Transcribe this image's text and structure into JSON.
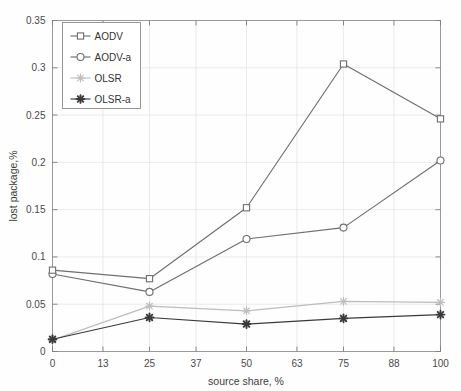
{
  "chart_data": {
    "type": "line",
    "title": "",
    "xlabel": "source share, %",
    "ylabel": "lost package,%",
    "xlim": [
      0,
      100
    ],
    "ylim": [
      0,
      0.35
    ],
    "grid": true,
    "legend_position": "top-left",
    "x": [
      0,
      25,
      50,
      75,
      100
    ],
    "xticks": [
      "0",
      "13",
      "25",
      "37",
      "50",
      "63",
      "75",
      "88",
      "100"
    ],
    "xtick_values": [
      0,
      13,
      25,
      37,
      50,
      63,
      75,
      88,
      100
    ],
    "yticks": [
      "0",
      "0.05",
      "0.1",
      "0.15",
      "0.2",
      "0.25",
      "0.3",
      "0.35"
    ],
    "ytick_values": [
      0,
      0.05,
      0.1,
      0.15,
      0.2,
      0.25,
      0.3,
      0.35
    ],
    "series": [
      {
        "name": "AODV",
        "marker": "square",
        "color": "#6f6f6f",
        "values": [
          0.086,
          0.077,
          0.152,
          0.304,
          0.246
        ]
      },
      {
        "name": "AODV-a",
        "marker": "circle",
        "color": "#6f6f6f",
        "values": [
          0.082,
          0.063,
          0.119,
          0.131,
          0.202
        ]
      },
      {
        "name": "OLSR",
        "marker": "asterisk",
        "color": "#bdbdbd",
        "values": [
          0.012,
          0.048,
          0.043,
          0.053,
          0.052
        ]
      },
      {
        "name": "OLSR-a",
        "marker": "asterisk-filled",
        "color": "#3a3a3a",
        "values": [
          0.013,
          0.036,
          0.029,
          0.035,
          0.039
        ]
      }
    ]
  },
  "axis": {
    "x_label": "source share, %",
    "y_label": "lost package,%"
  },
  "legend": {
    "entries": [
      {
        "label": "AODV"
      },
      {
        "label": "AODV-a"
      },
      {
        "label": "OLSR"
      },
      {
        "label": "OLSR-a"
      }
    ]
  },
  "colors": {
    "aodv": "#6f6f6f",
    "aodv_a": "#6f6f6f",
    "olsr": "#bdbdbd",
    "olsr_a": "#3a3a3a",
    "grid": "#e2e2e2",
    "frame": "#9a9a9a",
    "background": "#fefefe"
  }
}
